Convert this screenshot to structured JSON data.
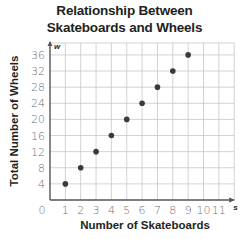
{
  "chart_data": {
    "type": "scatter",
    "title": "Relationship Between Skateboards and Wheels",
    "title_lines": [
      "Relationship Between",
      "Skateboards and Wheels"
    ],
    "xlabel": "Number of Skateboards",
    "ylabel": "Total Number of Wheels",
    "x_axis_variable": "s",
    "y_axis_variable": "w",
    "x": [
      1,
      2,
      3,
      4,
      5,
      6,
      7,
      8,
      9
    ],
    "y": [
      4,
      8,
      12,
      16,
      20,
      24,
      28,
      32,
      36
    ],
    "series": [
      {
        "name": "Wheels",
        "x": [
          1,
          2,
          3,
          4,
          5,
          6,
          7,
          8,
          9
        ],
        "values": [
          4,
          8,
          12,
          16,
          20,
          24,
          28,
          32,
          36
        ]
      }
    ],
    "x_ticks": [
      "0",
      "1",
      "2",
      "3",
      "4",
      "5",
      "6",
      "7",
      "8",
      "9",
      "10",
      "11"
    ],
    "y_ticks": [
      "4",
      "8",
      "12",
      "16",
      "20",
      "24",
      "28",
      "32",
      "36"
    ],
    "xlim": [
      0,
      12
    ],
    "ylim": [
      0,
      38
    ],
    "grid": true,
    "legend": "none",
    "colors": {
      "point": "#3a3a3c",
      "grid": "#c8c8c8",
      "axis": "#555555",
      "text": "#231f20",
      "tick_text": "#6d6e70"
    }
  }
}
